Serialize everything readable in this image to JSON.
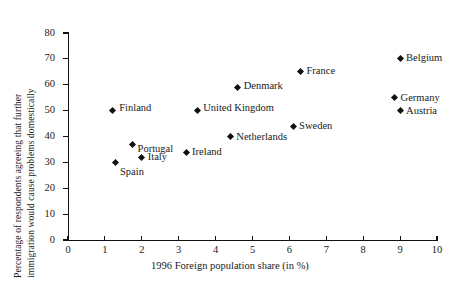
{
  "chart_data": {
    "type": "scatter",
    "title": "",
    "xlabel": "1996 Foreign population share (in %)",
    "ylabel_line1": "Percentage of respondents agreeing that further",
    "ylabel_line2": "immigration would cause problems domestically",
    "xlim": [
      0,
      10
    ],
    "ylim": [
      0,
      80
    ],
    "xticks": [
      0,
      1,
      2,
      3,
      4,
      5,
      6,
      7,
      8,
      9,
      10
    ],
    "yticks": [
      0,
      10,
      20,
      30,
      40,
      50,
      60,
      70,
      80
    ],
    "grid": false,
    "legend": "none",
    "points": [
      {
        "label": "Spain",
        "x": 1.3,
        "y": 30,
        "label_dx": 4,
        "label_dy": 10
      },
      {
        "label": "Finland",
        "x": 1.2,
        "y": 50,
        "label_dx": 7,
        "label_dy": -3
      },
      {
        "label": "Portugal",
        "x": 1.75,
        "y": 37,
        "label_dx": 5,
        "label_dy": 5
      },
      {
        "label": "Italy",
        "x": 2.0,
        "y": 32,
        "label_dx": 6,
        "label_dy": 0
      },
      {
        "label": "Ireland",
        "x": 3.2,
        "y": 34,
        "label_dx": 6,
        "label_dy": 0
      },
      {
        "label": "United Kingdom",
        "x": 3.5,
        "y": 50,
        "label_dx": 6,
        "label_dy": -3
      },
      {
        "label": "Netherlands",
        "x": 4.4,
        "y": 40,
        "label_dx": 6,
        "label_dy": 0
      },
      {
        "label": "Denmark",
        "x": 4.6,
        "y": 59,
        "label_dx": 6,
        "label_dy": -1
      },
      {
        "label": "Sweden",
        "x": 6.1,
        "y": 44,
        "label_dx": 6,
        "label_dy": 0
      },
      {
        "label": "France",
        "x": 6.3,
        "y": 65,
        "label_dx": 6,
        "label_dy": -1
      },
      {
        "label": "Belgium",
        "x": 9.0,
        "y": 70,
        "label_dx": 6,
        "label_dy": -1
      },
      {
        "label": "Germany",
        "x": 8.85,
        "y": 55,
        "label_dx": 6,
        "label_dy": 0
      },
      {
        "label": "Austria",
        "x": 9.0,
        "y": 50,
        "label_dx": 6,
        "label_dy": 0
      }
    ],
    "trendline": {
      "x0": 1.4,
      "y0": 38,
      "x1": 8.7,
      "y1": 56,
      "color": "#111111"
    }
  }
}
